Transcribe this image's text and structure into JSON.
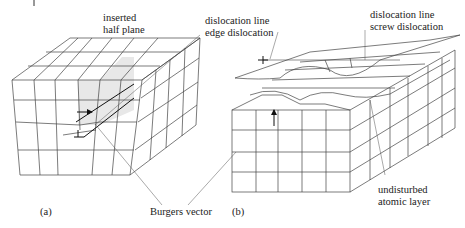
{
  "figure": {
    "panel_a": {
      "label": "(a)",
      "annotations": {
        "inserted_half_plane_1": "inserted",
        "inserted_half_plane_2": "half plane",
        "dislocation_line_1": "dislocation line",
        "dislocation_line_2": "edge dislocation"
      }
    },
    "panel_b": {
      "label": "(b)",
      "annotations": {
        "dislocation_line_1": "dislocation line",
        "dislocation_line_2": "screw dislocation",
        "undisturbed_1": "undisturbed",
        "undisturbed_2": "atomic layer"
      }
    },
    "shared": {
      "burgers_vector": "Burgers vector"
    },
    "colors": {
      "line": "#333333",
      "half_plane_fill": "#e6e6e6",
      "text": "#222222"
    }
  }
}
